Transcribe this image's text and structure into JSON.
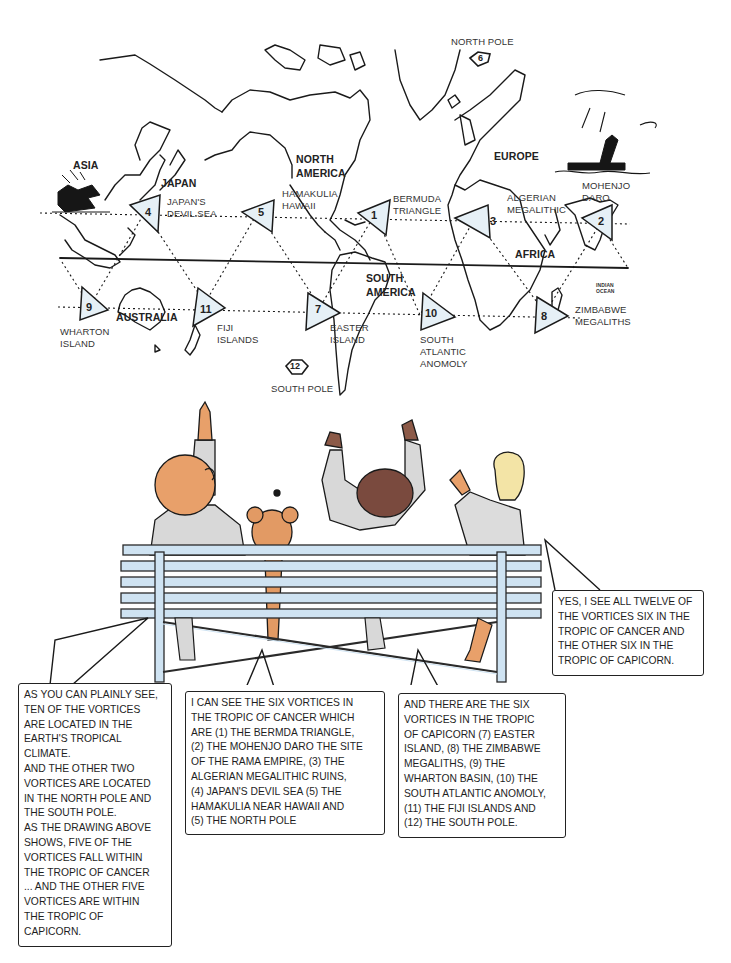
{
  "map": {
    "continents": {
      "asia": "ASIA",
      "japan": "JAPAN",
      "north_america": "NORTH AMERICA",
      "europe": "EUROPE",
      "africa": "AFRICA",
      "south_america": "SOUTH AMERICA",
      "australia": "AUSTRALIA",
      "indian_ocean": "INDIAN OCEAN"
    },
    "vortices": [
      {
        "number": "1",
        "label_lines": [
          "BERMUDA",
          "TRIANGLE"
        ],
        "tropic": "cancer"
      },
      {
        "number": "2",
        "label_lines": [
          "MOHENJO",
          "DARO"
        ],
        "tropic": "cancer"
      },
      {
        "number": "3",
        "label_lines": [
          "ALGERIAN",
          "MEGALITHIC"
        ],
        "tropic": "cancer"
      },
      {
        "number": "4",
        "label_lines": [
          "JAPAN'S",
          "DEVIL SEA"
        ],
        "tropic": "cancer"
      },
      {
        "number": "5",
        "label_lines": [
          "HAMAKULIA",
          "HAWAII"
        ],
        "tropic": "cancer"
      },
      {
        "number": "6",
        "label_lines": [
          "NORTH POLE"
        ],
        "tropic": "pole"
      },
      {
        "number": "7",
        "label_lines": [
          "EASTER",
          "ISLAND"
        ],
        "tropic": "capricorn"
      },
      {
        "number": "8",
        "label_lines": [
          "ZIMBABWE",
          "MEGALITHS"
        ],
        "tropic": "capricorn"
      },
      {
        "number": "9",
        "label_lines": [
          "WHARTON",
          "ISLAND"
        ],
        "tropic": "capricorn"
      },
      {
        "number": "10",
        "label_lines": [
          "SOUTH",
          "ATLANTIC",
          "ANOMOLY"
        ],
        "tropic": "capricorn"
      },
      {
        "number": "11",
        "label_lines": [
          "FIJI",
          "ISLANDS"
        ],
        "tropic": "capricorn"
      },
      {
        "number": "12",
        "label_lines": [
          "SOUTH POLE"
        ],
        "tropic": "pole"
      }
    ],
    "colors": {
      "line": "#1a1a1a",
      "triangle_fill": "#e6f0f6",
      "triangle_tint": "#f3dede"
    }
  },
  "scene": {
    "colors": {
      "bench": "#cfe3f2",
      "bench_line": "#2a2a2a",
      "skin": "#e8a06a",
      "dog": "#e29a64",
      "hair_brown": "#7a4a3e",
      "hair_blonde": "#f3e4a6",
      "clothes": "#d8d8d8"
    }
  },
  "bubbles": {
    "left": {
      "lines": [
        "AS YOU CAN PLAINLY SEE,",
        "TEN OF THE VORTICES",
        "ARE LOCATED IN THE",
        "EARTH'S TROPICAL",
        "CLIMATE.",
        "AND THE OTHER TWO",
        "VORTICES ARE LOCATED",
        "IN THE NORTH POLE AND",
        "THE SOUTH POLE.",
        "AS THE DRAWING ABOVE",
        "SHOWS, FIVE OF THE",
        "VORTICES FALL WITHIN",
        "THE TROPIC OF CANCER",
        "... AND THE OTHER FIVE",
        "VORTICES ARE WITHIN",
        "THE TROPIC OF",
        "CAPICORN."
      ]
    },
    "center": {
      "lines": [
        "I CAN SEE THE SIX VORTICES IN",
        "THE TROPIC OF CANCER WHICH",
        "ARE (1) THE BERMDA TRIANGLE,",
        "(2) THE MOHENJO DARO THE SITE",
        "OF THE RAMA EMPIRE, (3) THE",
        "ALGERIAN MEGALITHIC RUINS,",
        "(4) JAPAN'S DEVIL SEA (5) THE",
        "HAMAKULIA NEAR HAWAII AND",
        "(5) THE NORTH POLE"
      ]
    },
    "right_center": {
      "lines": [
        "AND THERE ARE THE SIX",
        "VORTICES IN THE TROPIC",
        "OF CAPICORN (7) EASTER",
        "ISLAND, (8) THE ZIMBABWE",
        "MEGALITHS, (9) THE",
        "WHARTON BASIN, (10) THE",
        "SOUTH ATLANTIC ANOMOLY,",
        "(11) THE FIJI ISLANDS AND",
        "(12) THE SOUTH POLE."
      ]
    },
    "right": {
      "lines": [
        "YES, I SEE ALL TWELVE OF",
        "THE VORTICES SIX IN THE",
        "TROPIC OF CANCER AND",
        "THE OTHER SIX IN THE",
        "TROPIC OF CAPICORN."
      ]
    }
  }
}
